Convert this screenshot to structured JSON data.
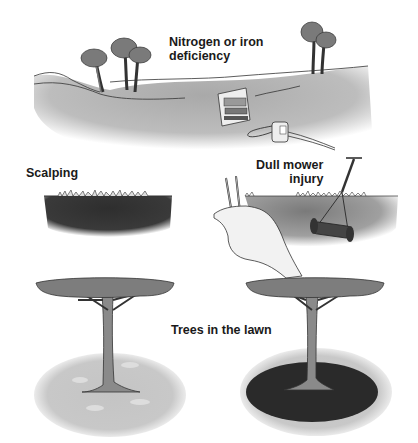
{
  "labels": {
    "nitrogen_line1": "Nitrogen or iron",
    "nitrogen_line2": "deficiency",
    "scalping": "Scalping",
    "dull_line1": "Dull mower",
    "dull_line2": "injury",
    "trees": "Trees in the lawn"
  },
  "colors": {
    "ground": "#b4b4b4",
    "ground_dark": "#8e8e8e",
    "foliage": "#7d7d7d",
    "trunk": "#8a8a8a",
    "outline": "#2a2a2a",
    "soil": "#333333",
    "mulch": "#262626"
  }
}
